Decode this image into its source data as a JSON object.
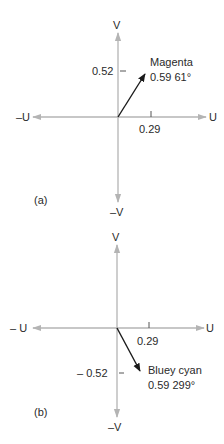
{
  "colors": {
    "axis": "#b4b4b4",
    "vector": "#1a1a1a",
    "text": "#2a2a2a"
  },
  "diagram_a": {
    "panel_label": "(a)",
    "axis_labels": {
      "v_pos": "V",
      "v_neg": "–V",
      "u_pos": "U",
      "u_neg": "–U"
    },
    "u_tick_label": "0.29",
    "v_tick_label": "0.52",
    "vector": {
      "name": "Magenta",
      "magnitude_angle": "0.59  61°",
      "magnitude": 0.59,
      "angle_deg": 61,
      "u": 0.29,
      "v": 0.52
    }
  },
  "diagram_b": {
    "panel_label": "(b)",
    "axis_labels": {
      "v_pos": "V",
      "v_neg": "–V",
      "u_pos": "U",
      "u_neg": "– U"
    },
    "u_tick_label": "0.29",
    "v_tick_label": "– 0.52",
    "vector": {
      "name": "Bluey cyan",
      "magnitude_angle": "0.59 299°",
      "magnitude": 0.59,
      "angle_deg": 299,
      "u": 0.29,
      "v": -0.52
    }
  }
}
